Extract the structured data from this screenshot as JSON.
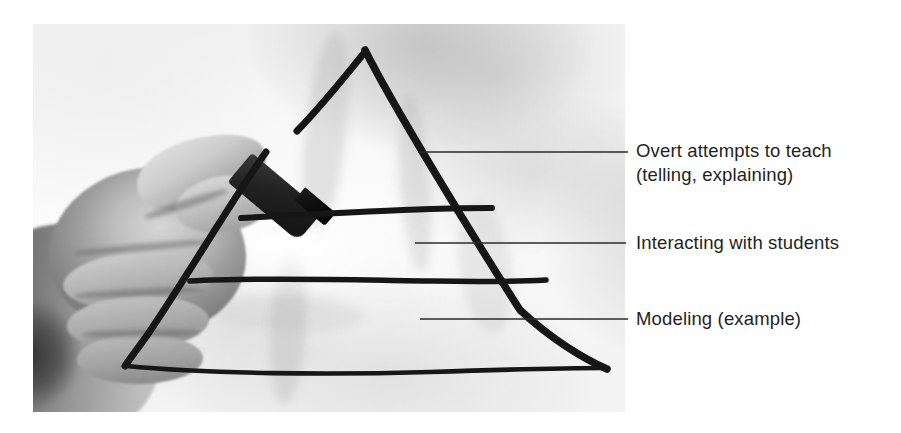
{
  "figure": {
    "name": "teaching-pyramid-whiteboard-photo",
    "media": "grayscale photograph of a hand drawing a pyramid diagram with a marker",
    "background_color": "#ffffff",
    "ink_color": "#111111",
    "text_color": "#231f20"
  },
  "photo": {
    "alt": "A hand holding a black marker drawing a large triangle divided into horizontal bands on a white surface",
    "x": 33,
    "y": 24,
    "width": 592,
    "height": 388
  },
  "diagram": {
    "shape": "pyramid",
    "band_count": 4,
    "apex": {
      "x": 365,
      "y": 50
    },
    "base_left": {
      "x": 125,
      "y": 366
    },
    "base_right": {
      "x": 607,
      "y": 368
    }
  },
  "callouts": [
    {
      "id": "callout-overt-attempts",
      "line1": "Overt attempts to teach",
      "line2": "(telling, explaining)",
      "leader_line": {
        "x1": 418,
        "y1": 152,
        "x2": 628,
        "y2": 152
      }
    },
    {
      "id": "callout-interacting",
      "line1": "Interacting with students",
      "line2": "",
      "leader_line": {
        "x1": 415,
        "y1": 243,
        "x2": 626,
        "y2": 243
      }
    },
    {
      "id": "callout-modeling",
      "line1": "Modeling (example)",
      "line2": "",
      "leader_line": {
        "x1": 420,
        "y1": 319,
        "x2": 628,
        "y2": 319
      }
    }
  ]
}
